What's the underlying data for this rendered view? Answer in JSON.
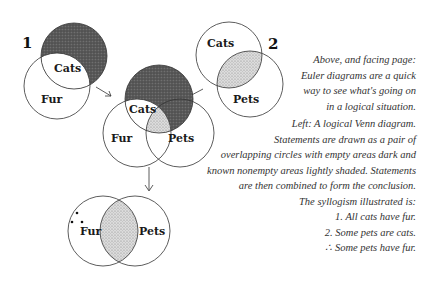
{
  "diagram": {
    "premise1": {
      "number": "1",
      "top_label": "Cats",
      "bottom_label": "Fur"
    },
    "premise2": {
      "number": "2",
      "top_label": "Cats",
      "bottom_label": "Pets"
    },
    "combined": {
      "top_label": "Cats",
      "left_label": "Fur",
      "right_label": "Pets"
    },
    "conclusion": {
      "symbol": "∴",
      "left_label": "Fur",
      "right_label": "Pets"
    },
    "colors": {
      "dark_fill": "#555555",
      "light_fill": "#cfcfcf",
      "stroke": "#333333"
    }
  },
  "caption_top": [
    "Above, and facing page:",
    "Euler diagrams are a quick",
    "way to see what's going on",
    "in a logical situation."
  ],
  "caption_bottom": [
    "Left:  A logical Venn diagram.",
    "Statements are drawn as a pair of",
    "overlapping circles with empty areas dark and",
    "known nonempty areas lightly shaded.  Statements",
    "are then combined to form the conclusion.",
    "The syllogism illustrated is:"
  ],
  "syllogism": [
    "1.  All cats have fur.",
    "2.  Some pets are cats.",
    "∴   Some pets have fur."
  ]
}
